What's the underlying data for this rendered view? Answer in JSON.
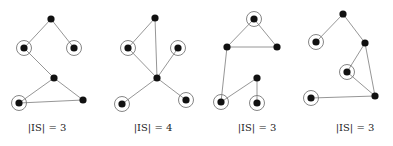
{
  "figure": {
    "colors": {
      "node": "#111111",
      "edge": "#8a8a8a",
      "ring": "#777777",
      "text": "#222222"
    },
    "graphs": [
      {
        "label": "|IS| = 3",
        "label_pos": [
          47,
          131
        ],
        "nodes": [
          {
            "id": "a",
            "x": 51,
            "y": 19,
            "in_set": false
          },
          {
            "id": "b",
            "x": 24,
            "y": 48,
            "in_set": true
          },
          {
            "id": "c",
            "x": 74,
            "y": 48,
            "in_set": true
          },
          {
            "id": "d",
            "x": 54,
            "y": 78,
            "in_set": false
          },
          {
            "id": "e",
            "x": 19,
            "y": 103,
            "in_set": true
          },
          {
            "id": "f",
            "x": 83,
            "y": 100,
            "in_set": false
          }
        ],
        "edges": [
          [
            "a",
            "b"
          ],
          [
            "a",
            "c"
          ],
          [
            "b",
            "d"
          ],
          [
            "d",
            "e"
          ],
          [
            "d",
            "f"
          ],
          [
            "e",
            "f"
          ]
        ]
      },
      {
        "label": "|IS| = 4",
        "label_pos": [
          153,
          131
        ],
        "nodes": [
          {
            "id": "a",
            "x": 155,
            "y": 18,
            "in_set": false
          },
          {
            "id": "b",
            "x": 128,
            "y": 48,
            "in_set": true
          },
          {
            "id": "c",
            "x": 178,
            "y": 48,
            "in_set": true
          },
          {
            "id": "d",
            "x": 157,
            "y": 78,
            "in_set": false
          },
          {
            "id": "e",
            "x": 122,
            "y": 104,
            "in_set": true
          },
          {
            "id": "f",
            "x": 186,
            "y": 100,
            "in_set": true
          }
        ],
        "edges": [
          [
            "a",
            "b"
          ],
          [
            "a",
            "d"
          ],
          [
            "b",
            "d"
          ],
          [
            "c",
            "d"
          ],
          [
            "d",
            "e"
          ],
          [
            "d",
            "f"
          ]
        ]
      },
      {
        "label": "|IS| = 3",
        "label_pos": [
          257,
          131
        ],
        "nodes": [
          {
            "id": "a",
            "x": 254,
            "y": 19,
            "in_set": true
          },
          {
            "id": "b",
            "x": 227,
            "y": 47,
            "in_set": false
          },
          {
            "id": "c",
            "x": 277,
            "y": 47,
            "in_set": false
          },
          {
            "id": "d",
            "x": 257,
            "y": 78,
            "in_set": false
          },
          {
            "id": "e",
            "x": 221,
            "y": 102,
            "in_set": true
          },
          {
            "id": "f",
            "x": 257,
            "y": 103,
            "in_set": true
          }
        ],
        "edges": [
          [
            "a",
            "b"
          ],
          [
            "a",
            "c"
          ],
          [
            "b",
            "c"
          ],
          [
            "b",
            "e"
          ],
          [
            "d",
            "e"
          ],
          [
            "d",
            "f"
          ]
        ]
      },
      {
        "label": "|IS| = 3",
        "label_pos": [
          355,
          131
        ],
        "nodes": [
          {
            "id": "a",
            "x": 343,
            "y": 14,
            "in_set": false
          },
          {
            "id": "b",
            "x": 316,
            "y": 42,
            "in_set": true
          },
          {
            "id": "c",
            "x": 365,
            "y": 43,
            "in_set": false
          },
          {
            "id": "d",
            "x": 347,
            "y": 72,
            "in_set": true
          },
          {
            "id": "e",
            "x": 375,
            "y": 96,
            "in_set": false
          },
          {
            "id": "f",
            "x": 311,
            "y": 98,
            "in_set": true
          }
        ],
        "edges": [
          [
            "a",
            "b"
          ],
          [
            "a",
            "c"
          ],
          [
            "c",
            "d"
          ],
          [
            "c",
            "e"
          ],
          [
            "d",
            "e"
          ],
          [
            "f",
            "e"
          ]
        ]
      }
    ]
  }
}
